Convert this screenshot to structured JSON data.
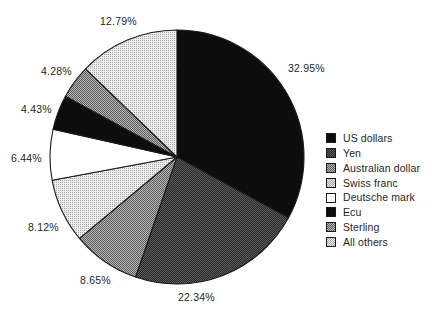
{
  "chart_data": {
    "type": "pie",
    "title": "",
    "subtitle": "",
    "xlabel": "",
    "ylabel": "",
    "grid": false,
    "legend_position": "right",
    "start_angle_deg": 0,
    "direction": "clockwise",
    "categories": [
      "US dollars",
      "Yen",
      "Australian dollar",
      "Swiss franc",
      "Deutsche mark",
      "Ecu",
      "Sterling",
      "All others"
    ],
    "values": [
      32.95,
      22.34,
      8.65,
      8.12,
      6.44,
      4.43,
      4.28,
      12.79
    ],
    "value_labels": [
      "32.95%",
      "22.34%",
      "8.65%",
      "8.12%",
      "6.44%",
      "4.43%",
      "4.28%",
      "12.79%"
    ],
    "units": "percent",
    "total": 100.0
  },
  "pie": {
    "center_x": 177,
    "center_y": 157,
    "radius": 127,
    "outline_color": "#1a1a1a",
    "slices": [
      {
        "label": "US dollars",
        "value": 32.95,
        "value_label": "32.95%",
        "fill": "#0d0d0d",
        "pattern": "solid-black",
        "label_x": 288,
        "label_y": 63
      },
      {
        "label": "Yen",
        "value": 22.34,
        "value_label": "22.34%",
        "fill": "#3f3f3f",
        "pattern": "dense-dark-halftone",
        "label_x": 178,
        "label_y": 292
      },
      {
        "label": "Australian dollar",
        "value": 8.65,
        "value_label": "8.65%",
        "fill": "#8a8a8a",
        "pattern": "mid-halftone",
        "label_x": 80,
        "label_y": 275
      },
      {
        "label": "Swiss franc",
        "value": 8.12,
        "value_label": "8.12%",
        "fill": "#c9c9c9",
        "pattern": "light-halftone",
        "label_x": 28,
        "label_y": 222
      },
      {
        "label": "Deutsche mark",
        "value": 6.44,
        "value_label": "6.44%",
        "fill": "#ffffff",
        "pattern": "white",
        "label_x": 11,
        "label_y": 153
      },
      {
        "label": "Ecu",
        "value": 4.43,
        "value_label": "4.43%",
        "fill": "#111111",
        "pattern": "solid-black",
        "label_x": 21,
        "label_y": 104
      },
      {
        "label": "Sterling",
        "value": 4.28,
        "value_label": "4.28%",
        "fill": "#8a8a8a",
        "pattern": "mid-halftone",
        "label_x": 41,
        "label_y": 66
      },
      {
        "label": "All others",
        "value": 12.79,
        "value_label": "12.79%",
        "fill": "#c9c9c9",
        "pattern": "light-halftone",
        "label_x": 100,
        "label_y": 16
      }
    ]
  },
  "legend": {
    "items": [
      {
        "label": "US dollars",
        "swatch": "#0d0d0d",
        "pattern": "solid-black"
      },
      {
        "label": "Yen",
        "swatch": "#3f3f3f",
        "pattern": "dense-dark-halftone"
      },
      {
        "label": "Australian dollar",
        "swatch": "#8a8a8a",
        "pattern": "mid-halftone"
      },
      {
        "label": "Swiss franc",
        "swatch": "#c9c9c9",
        "pattern": "light-halftone"
      },
      {
        "label": "Deutsche mark",
        "swatch": "#ffffff",
        "pattern": "white"
      },
      {
        "label": "Ecu",
        "swatch": "#111111",
        "pattern": "solid-black"
      },
      {
        "label": "Sterling",
        "swatch": "#8a8a8a",
        "pattern": "mid-halftone"
      },
      {
        "label": "All others",
        "swatch": "#c9c9c9",
        "pattern": "light-halftone"
      }
    ]
  }
}
